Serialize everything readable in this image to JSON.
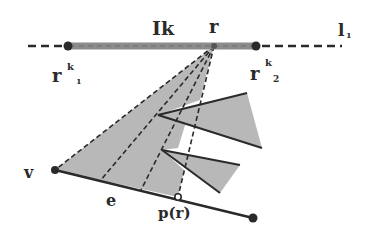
{
  "figure": {
    "colors": {
      "ink": "#2a2a2a",
      "shade": "#b8b8b8",
      "bar": "#8c8c8c",
      "background": "#ffffff"
    },
    "labels": {
      "interval": "Ik",
      "point_r": "r",
      "line": "l",
      "line_sub": "1",
      "r1_base": "r",
      "r1_sup": "k",
      "r1_sub": "1",
      "r2_base": "r",
      "r2_sup": "k",
      "r2_sub": "2",
      "vertex": "v",
      "edge": "e",
      "projection": "p(r)"
    }
  }
}
